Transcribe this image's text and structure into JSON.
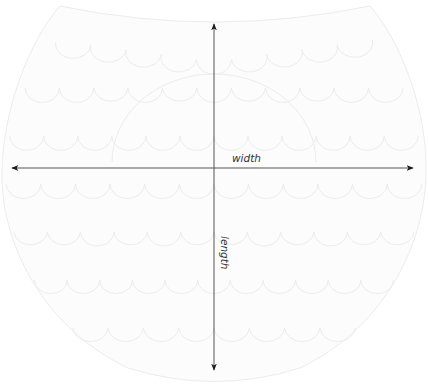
{
  "diagram": {
    "title": "",
    "shape": "scalloped-bib",
    "labels": {
      "width": "width",
      "length": "length"
    },
    "colors": {
      "background": "#ffffff",
      "shape_fill": "#fcfcfc",
      "shape_stroke": "#ececec",
      "arrow": "#2a2a2a"
    },
    "arrows": [
      {
        "name": "width-arrow",
        "direction": "horizontal",
        "heads": "both",
        "label": "width"
      },
      {
        "name": "length-arrow",
        "direction": "vertical",
        "heads": "both",
        "label": "length"
      }
    ],
    "scallop_tiers": 7
  }
}
